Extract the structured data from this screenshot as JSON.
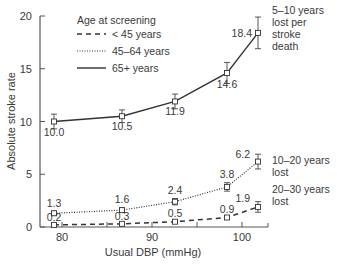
{
  "chart_data": {
    "type": "line",
    "title": "",
    "xlabel": "Usual DBP (mmHg)",
    "ylabel": "Absolute stroke rate",
    "xlim": [
      78,
      106
    ],
    "ylim": [
      0,
      20
    ],
    "x_ticks": [
      80,
      90,
      100
    ],
    "x_minor_ticks": [
      85,
      95,
      105
    ],
    "y_ticks": [
      0,
      5,
      10,
      15,
      20
    ],
    "grid": false,
    "legend": {
      "title": "Age at screening",
      "position": "upper-left",
      "entries": [
        {
          "label": "< 45 years",
          "style": "dashed"
        },
        {
          "label": "45–64 years",
          "style": "dotted"
        },
        {
          "label": "65+ years",
          "style": "solid"
        }
      ]
    },
    "x": [
      79.1,
      86.7,
      92.6,
      98.3,
      101.8
    ],
    "series": [
      {
        "name": "65+ years",
        "style": "solid",
        "values": [
          10.0,
          10.5,
          11.9,
          14.6,
          18.4
        ],
        "labels": [
          "10.0",
          "10.5",
          "11.9",
          "14.6",
          "18.4"
        ],
        "errors": [
          0.7,
          0.6,
          0.7,
          1.0,
          1.5
        ],
        "annotation": [
          "5–10 years",
          "lost per",
          "stroke",
          "death"
        ]
      },
      {
        "name": "45–64 years",
        "style": "dotted",
        "values": [
          1.3,
          1.6,
          2.4,
          3.8,
          6.2
        ],
        "labels": [
          "1.3",
          "1.6",
          "2.4",
          "3.8",
          "6.2"
        ],
        "errors": [
          0.2,
          0.2,
          0.3,
          0.4,
          0.7
        ],
        "annotation": [
          "10–20 years",
          "lost"
        ]
      },
      {
        "name": "< 45 years",
        "style": "dashed",
        "values": [
          0.2,
          0.3,
          0.5,
          0.9,
          1.9
        ],
        "labels": [
          "0.2",
          "0.3",
          "0.5",
          "0.9",
          "1.9"
        ],
        "errors": [
          0.1,
          0.1,
          0.1,
          0.15,
          0.5
        ],
        "annotation": [
          "20–30 years",
          "lost"
        ]
      }
    ]
  },
  "axes": {
    "x_tick_labels": [
      "80",
      "90",
      "100"
    ],
    "y_tick_labels": [
      "0",
      "5",
      "10",
      "15",
      "20"
    ]
  }
}
